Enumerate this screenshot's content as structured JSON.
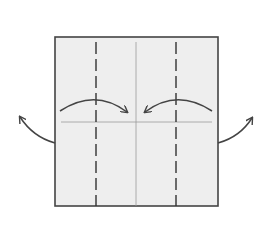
{
  "diagram": {
    "type": "origami-fold-diagram",
    "paper": {
      "x": 55,
      "y": 37,
      "width": 163,
      "height": 169,
      "fill": "#eeeeee",
      "stroke": "#444444"
    },
    "creases": [
      {
        "kind": "center-vertical",
        "x": 136,
        "style": "solid-thin"
      },
      {
        "kind": "center-horizontal",
        "y": 122,
        "style": "solid-thin"
      }
    ],
    "valley_folds": [
      {
        "side": "left",
        "x": 96,
        "style": "dashed"
      },
      {
        "side": "right",
        "x": 176,
        "style": "dashed"
      }
    ],
    "arrows": [
      {
        "name": "fold-left-in",
        "direction": "to-center"
      },
      {
        "name": "fold-right-in",
        "direction": "to-center"
      },
      {
        "name": "unfold-left-out",
        "direction": "outward-left"
      },
      {
        "name": "unfold-right-out",
        "direction": "outward-right"
      }
    ],
    "colors": {
      "paper": "#eeeeee",
      "outline": "#444444",
      "crease": "#888888",
      "arrow": "#444444"
    }
  }
}
